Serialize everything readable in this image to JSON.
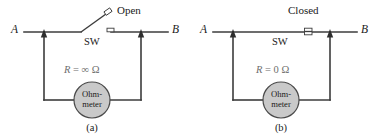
{
  "figure": {
    "type": "circuit-diagram",
    "panels": [
      {
        "id": "a",
        "caption": "(a)",
        "terminal_left": "A",
        "terminal_right": "B",
        "switch_state_label": "Open",
        "switch_label": "SW",
        "resistance_label": {
          "symbol": "R",
          "equals": "=",
          "value": "∞",
          "unit": "Ω",
          "full": "R = ∞ Ω"
        },
        "meter_line1": "Ohm-",
        "meter_line2": "meter"
      },
      {
        "id": "b",
        "caption": "(b)",
        "terminal_left": "A",
        "terminal_right": "B",
        "switch_state_label": "Closed",
        "switch_label": "SW",
        "resistance_label": {
          "symbol": "R",
          "equals": "=",
          "value": "0",
          "unit": "Ω",
          "full": "R = 0 Ω"
        },
        "meter_line1": "Ohm-",
        "meter_line2": "meter"
      }
    ],
    "colors": {
      "wire": "#3c3c3c",
      "meter_fill": "#c9c9c9",
      "meter_stroke": "#4a4a4a",
      "resistance_text": "#6e6e6e",
      "text": "#1a1a1a",
      "background": "#ffffff"
    }
  }
}
